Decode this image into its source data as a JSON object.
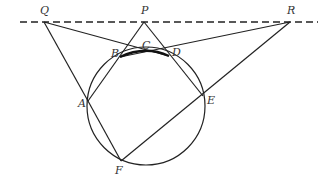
{
  "diagram": {
    "type": "geometry",
    "points": {
      "Q": {
        "label": "Q",
        "x": 44,
        "y": 22
      },
      "P": {
        "label": "P",
        "x": 144,
        "y": 22
      },
      "R": {
        "label": "R",
        "x": 290,
        "y": 22
      },
      "A": {
        "label": "A",
        "x": 88,
        "y": 101
      },
      "B": {
        "label": "B",
        "x": 120,
        "y": 57
      },
      "C": {
        "label": "C",
        "x": 147,
        "y": 52
      },
      "D": {
        "label": "D",
        "x": 169,
        "y": 56
      },
      "E": {
        "label": "E",
        "x": 203,
        "y": 96
      },
      "F": {
        "label": "F",
        "x": 121,
        "y": 161
      }
    },
    "circle": {
      "cx": 146,
      "cy": 106,
      "r": 59
    },
    "dashed_line": {
      "x1": 20,
      "y1": 22,
      "x2": 318,
      "y2": 22
    },
    "segments": [
      "Q-A",
      "Q-D",
      "P-B",
      "P-D",
      "R-B",
      "R-F",
      "A-F",
      "A-P",
      "D-E"
    ],
    "bold_arc": "B-C-D",
    "stroke_color": "#222222"
  }
}
